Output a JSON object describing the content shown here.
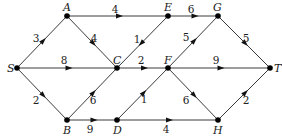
{
  "diagram": {
    "type": "directed weighted graph",
    "nodes": [
      {
        "id": "S",
        "label": "S",
        "x": 17,
        "y": 68,
        "lx": 7,
        "ly": 72
      },
      {
        "id": "A",
        "label": "A",
        "x": 67,
        "y": 16,
        "lx": 63,
        "ly": 11
      },
      {
        "id": "B",
        "label": "B",
        "x": 67,
        "y": 120,
        "lx": 63,
        "ly": 134
      },
      {
        "id": "C",
        "label": "C",
        "x": 117,
        "y": 68,
        "lx": 113,
        "ly": 64
      },
      {
        "id": "D",
        "label": "D",
        "x": 117,
        "y": 120,
        "lx": 113,
        "ly": 134
      },
      {
        "id": "E",
        "label": "E",
        "x": 168,
        "y": 16,
        "lx": 164,
        "ly": 11
      },
      {
        "id": "F",
        "label": "F",
        "x": 168,
        "y": 68,
        "lx": 164,
        "ly": 64
      },
      {
        "id": "G",
        "label": "G",
        "x": 218,
        "y": 16,
        "lx": 213,
        "ly": 11
      },
      {
        "id": "H",
        "label": "H",
        "x": 218,
        "y": 120,
        "lx": 213,
        "ly": 134
      },
      {
        "id": "T",
        "label": "T",
        "x": 270,
        "y": 68,
        "lx": 274,
        "ly": 72
      }
    ],
    "edges": [
      {
        "from": "S",
        "to": "A",
        "weight": "3",
        "wx": 36,
        "wy": 42
      },
      {
        "from": "S",
        "to": "C",
        "weight": "8",
        "wx": 64,
        "wy": 64
      },
      {
        "from": "S",
        "to": "B",
        "weight": "2",
        "wx": 36,
        "wy": 104
      },
      {
        "from": "A",
        "to": "E",
        "weight": "4",
        "wx": 115,
        "wy": 13
      },
      {
        "from": "A",
        "to": "C",
        "weight": "4",
        "wx": 94,
        "wy": 42
      },
      {
        "from": "E",
        "to": "C",
        "weight": "1",
        "wx": 137,
        "wy": 43
      },
      {
        "from": "C",
        "to": "F",
        "weight": "2",
        "wx": 141,
        "wy": 64
      },
      {
        "from": "B",
        "to": "C",
        "weight": "6",
        "wx": 93,
        "wy": 104
      },
      {
        "from": "B",
        "to": "D",
        "weight": "9",
        "wx": 90,
        "wy": 133
      },
      {
        "from": "D",
        "to": "F",
        "weight": "1",
        "wx": 144,
        "wy": 103
      },
      {
        "from": "D",
        "to": "H",
        "weight": "4",
        "wx": 166,
        "wy": 133
      },
      {
        "from": "E",
        "to": "G",
        "weight": "6",
        "wx": 191,
        "wy": 13
      },
      {
        "from": "F",
        "to": "G",
        "weight": "5",
        "wx": 186,
        "wy": 41
      },
      {
        "from": "F",
        "to": "T",
        "weight": "9",
        "wx": 216,
        "wy": 64
      },
      {
        "from": "F",
        "to": "H",
        "weight": "6",
        "wx": 186,
        "wy": 104
      },
      {
        "from": "G",
        "to": "T",
        "weight": "5",
        "wx": 246,
        "wy": 42
      },
      {
        "from": "H",
        "to": "T",
        "weight": "2",
        "wx": 246,
        "wy": 104
      }
    ]
  }
}
